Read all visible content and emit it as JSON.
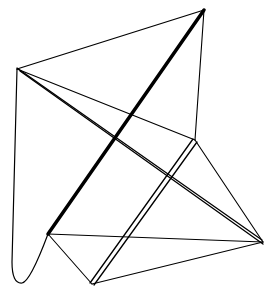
{
  "figure": {
    "title": "",
    "stroke_color": "#000000",
    "background": "#ffffff"
  },
  "vertices": {
    "top": [
      204,
      10
    ],
    "left": [
      17,
      69
    ],
    "mid_right": [
      195,
      140
    ],
    "right": [
      263,
      242
    ],
    "lower_left": [
      48,
      234
    ],
    "bottom": [
      92,
      284
    ]
  }
}
